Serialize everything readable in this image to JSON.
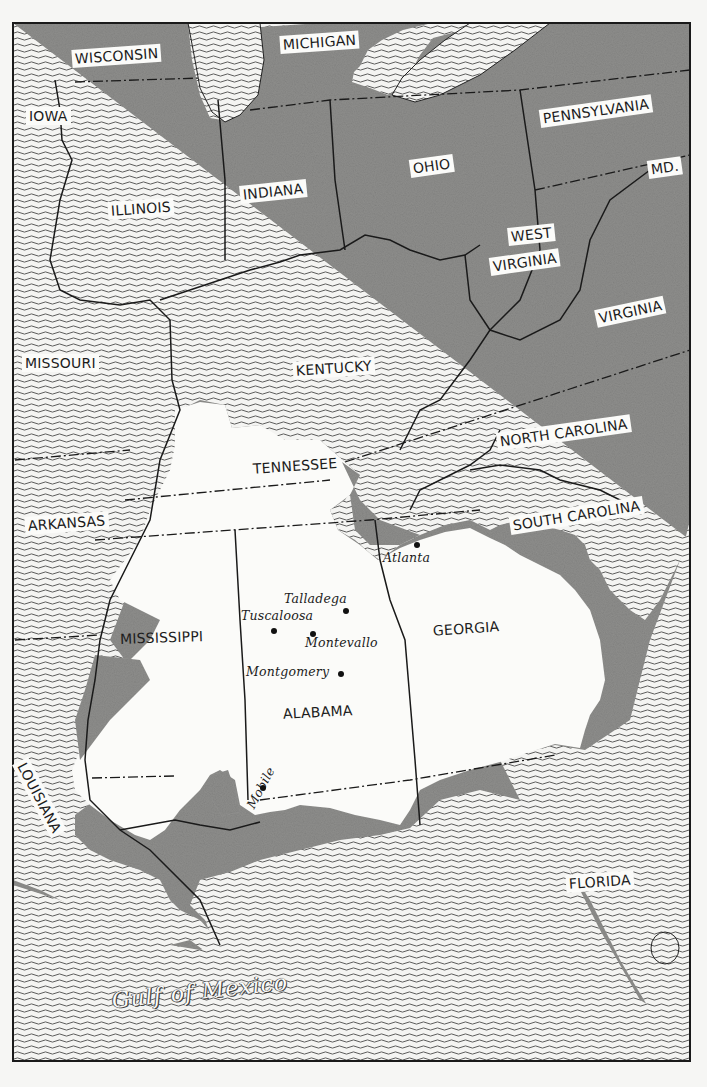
{
  "map": {
    "title": "Southeastern United States — white area region with cities",
    "colors": {
      "land_shaded": "#8e8e8c",
      "land_highlight": "#fbfbf9",
      "water_lines": "#555555",
      "border": "#1a1a1a",
      "paper": "#f6f6f4"
    },
    "states": [
      {
        "id": "wisconsin",
        "label": "WISCONSIN"
      },
      {
        "id": "michigan",
        "label": "MICHIGAN"
      },
      {
        "id": "iowa",
        "label": "IOWA"
      },
      {
        "id": "pennsylvania",
        "label": "PENNSYLVANIA"
      },
      {
        "id": "ohio",
        "label": "OHIO"
      },
      {
        "id": "maryland",
        "label": "MD."
      },
      {
        "id": "illinois",
        "label": "ILLINOIS"
      },
      {
        "id": "indiana",
        "label": "INDIANA"
      },
      {
        "id": "west_virginia_1",
        "label": "WEST"
      },
      {
        "id": "west_virginia_2",
        "label": "VIRGINIA"
      },
      {
        "id": "virginia",
        "label": "VIRGINIA"
      },
      {
        "id": "missouri",
        "label": "MISSOURI"
      },
      {
        "id": "kentucky",
        "label": "KENTUCKY"
      },
      {
        "id": "north_carolina",
        "label": "NORTH CAROLINA"
      },
      {
        "id": "tennessee",
        "label": "TENNESSEE"
      },
      {
        "id": "arkansas",
        "label": "ARKANSAS"
      },
      {
        "id": "south_carolina",
        "label": "SOUTH CAROLINA"
      },
      {
        "id": "mississippi",
        "label": "MISSISSIPPI"
      },
      {
        "id": "georgia",
        "label": "GEORGIA"
      },
      {
        "id": "alabama",
        "label": "ALABAMA"
      },
      {
        "id": "louisiana",
        "label": "LOUISIANA"
      },
      {
        "id": "florida",
        "label": "FLORIDA"
      }
    ],
    "cities": [
      {
        "id": "atlanta",
        "label": "Atlanta"
      },
      {
        "id": "talladega",
        "label": "Talladega"
      },
      {
        "id": "tuscaloosa",
        "label": "Tuscaloosa"
      },
      {
        "id": "montevallo",
        "label": "Montevallo"
      },
      {
        "id": "montgomery",
        "label": "Montgomery"
      },
      {
        "id": "mobile",
        "label": "Mobile"
      }
    ],
    "water": [
      {
        "id": "gulf_of_mexico",
        "label": "Gulf of Mexico"
      }
    ]
  }
}
